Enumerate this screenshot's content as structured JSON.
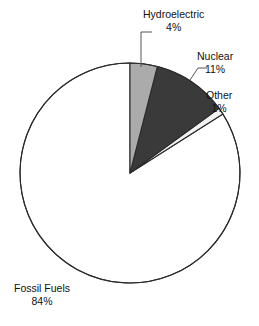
{
  "chart_data": {
    "type": "pie",
    "title": "",
    "subtitle": "",
    "xlabel": "",
    "ylabel": "",
    "legend_position": "none",
    "grid": false,
    "units": "percent",
    "start_angle_deg": 0,
    "direction": "clockwise",
    "categories": [
      "Hydroelectric",
      "Nuclear",
      "Other",
      "Fossil Fuels"
    ],
    "values": [
      4,
      11,
      1,
      84
    ],
    "slices": [
      {
        "label": "Hydroelectric",
        "value": 4,
        "value_text": "4%",
        "color": "#ababab",
        "stroke": "#2b2b2b",
        "start_deg": 0,
        "end_deg": 14.4,
        "leader": true
      },
      {
        "label": "Nuclear",
        "value": 11,
        "value_text": "11%",
        "color": "#3a3a3a",
        "stroke": "#2b2b2b",
        "start_deg": 14.4,
        "end_deg": 54.0,
        "leader": true
      },
      {
        "label": "Other",
        "value": 1,
        "value_text": "1%",
        "color": "#f2f2f2",
        "stroke": "#2b2b2b",
        "start_deg": 54.0,
        "end_deg": 57.6,
        "leader": false
      },
      {
        "label": "Fossil Fuels",
        "value": 84,
        "value_text": "84%",
        "color": "#ffffff",
        "stroke": "#2b2b2b",
        "start_deg": 57.6,
        "end_deg": 360.0,
        "leader": false
      }
    ]
  },
  "labels": {
    "hydroelectric": {
      "name": "Hydroelectric",
      "value": "4%"
    },
    "nuclear": {
      "name": "Nuclear",
      "value": "11%"
    },
    "other": {
      "name": "Other",
      "value": "1%"
    },
    "fossil_fuels": {
      "name": "Fossil Fuels",
      "value": "84%"
    }
  },
  "colors": {
    "hydroelectric": "#ababab",
    "nuclear": "#3a3a3a",
    "other": "#f2f2f2",
    "fossil_fuels": "#ffffff",
    "outline": "#2b2b2b",
    "leader_line": "#555555",
    "text": "#111111",
    "background": "#ffffff"
  }
}
